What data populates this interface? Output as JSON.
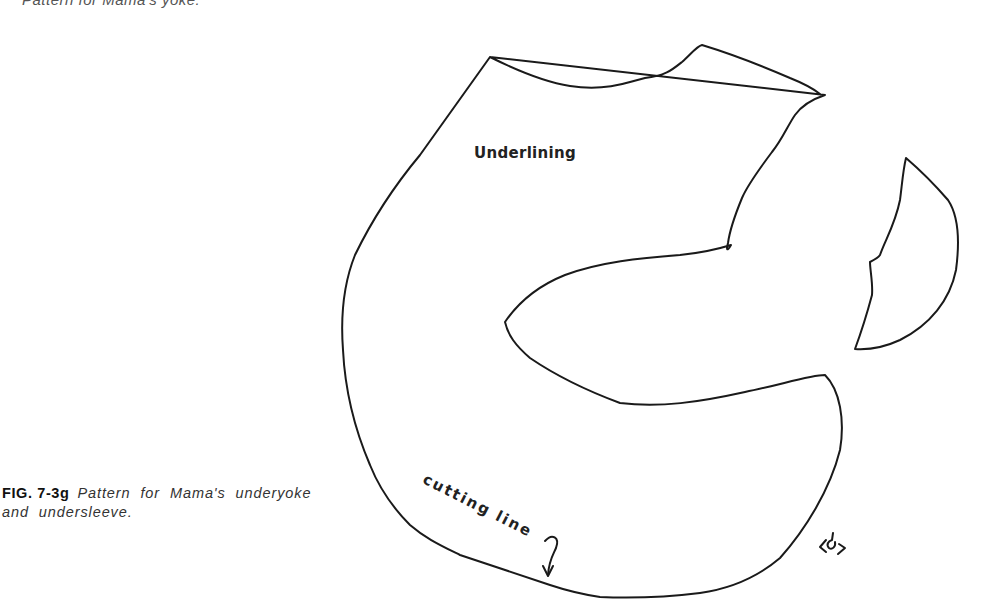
{
  "page": {
    "top_caption_fragment": "Pattern for Mama's yoke."
  },
  "figure": {
    "number": "FIG. 7-3g",
    "caption": "Pattern for Mama's underyoke and undersleeve.",
    "labels": {
      "piece_label": "Underlining",
      "cutting_line": "cutting line"
    },
    "pieces": [
      {
        "name": "underyoke",
        "description": "Large curved yoke pattern piece with inner sleeve-shaped notch"
      },
      {
        "name": "undersleeve",
        "description": "Small crescent-shaped sleeve pattern piece"
      }
    ],
    "signature_mark": "artist signature"
  },
  "colors": {
    "line": "#1a1a1a",
    "background": "#ffffff",
    "caption_text": "#333333"
  }
}
